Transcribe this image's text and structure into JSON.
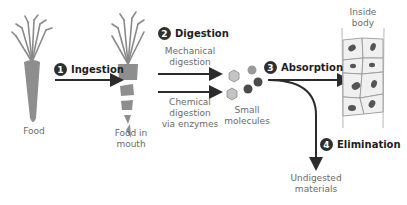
{
  "colors": {
    "arrow": "#2b2b2b",
    "label": "#6b6b6b",
    "badge": "#2f2f2f",
    "carrot": "#8a8a8a",
    "molecule_light": "#bdbdbd",
    "molecule_dark": "#4a4a4a",
    "cell_fill": "#f0f0f0",
    "cell_border": "#9a9a9a",
    "nucleus": "#555555"
  },
  "nodes": {
    "food": {
      "label": "Food",
      "icon": "whole-carrot"
    },
    "food_in_mouth": {
      "label": "Food in\nmouth",
      "label_line1": "Food in",
      "label_line2": "mouth",
      "icon": "chopped-carrot"
    },
    "small_molecules": {
      "label_line1": "Small",
      "label_line2": "molecules",
      "icon": "molecules"
    },
    "inside_body": {
      "label_line1": "Inside",
      "label_line2": "body",
      "icon": "body-cells"
    },
    "undigested": {
      "label_line1": "Undigested",
      "label_line2": "materials"
    }
  },
  "steps": [
    {
      "number": "1",
      "title": "Ingestion"
    },
    {
      "number": "2",
      "title": "Digestion",
      "sub": [
        {
          "line1": "Mechanical",
          "line2": "digestion"
        },
        {
          "line1": "Chemical",
          "line2": "digestion",
          "line3": "via enzymes"
        }
      ]
    },
    {
      "number": "3",
      "title": "Absorption"
    },
    {
      "number": "4",
      "title": "Elimination"
    }
  ]
}
